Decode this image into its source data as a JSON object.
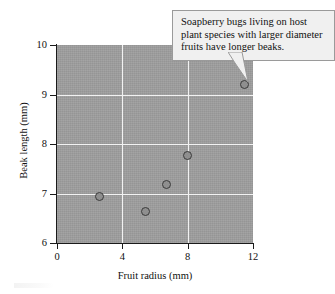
{
  "chart_data": {
    "type": "scatter",
    "title": "",
    "xlabel": "Fruit radius (mm)",
    "ylabel": "Beak length (mm)",
    "xlim": [
      0,
      12
    ],
    "ylim": [
      6,
      10
    ],
    "xticks": [
      "0",
      "4",
      "8",
      "12"
    ],
    "yticks": [
      "6",
      "7",
      "8",
      "9",
      "10"
    ],
    "grid": true,
    "legend": "none",
    "plot_background_color": "#9e9e9e",
    "gridline_color": "#f2f2f2",
    "point_fill_color": "#8f8f8f",
    "point_edge_color": "#3a3a3a",
    "points": [
      {
        "x": 2.6,
        "y": 6.95
      },
      {
        "x": 5.4,
        "y": 6.63
      },
      {
        "x": 6.7,
        "y": 7.19
      },
      {
        "x": 8.0,
        "y": 7.76
      },
      {
        "x": 11.5,
        "y": 9.2
      }
    ],
    "annotations": [
      {
        "text": "Soapberry bugs living on host plant species with larger diameter fruits have longer beaks.",
        "points_to": {
          "x": 11.5,
          "y": 9.2
        }
      }
    ]
  },
  "callout": {
    "text": "Soapberry bugs living on host plant species with larger diameter fruits have longer beaks.",
    "background_color": "#f0f0f0",
    "border_color": "#9a9a9a"
  },
  "axes": {
    "x_title": "Fruit radius (mm)",
    "y_title": "Beak length (mm)",
    "x_tick_labels": [
      "0",
      "4",
      "8",
      "12"
    ],
    "y_tick_labels": [
      "6",
      "7",
      "8",
      "9",
      "10"
    ]
  }
}
